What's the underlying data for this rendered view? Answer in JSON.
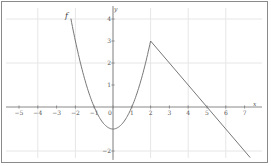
{
  "chart_data": {
    "type": "line",
    "title": "",
    "function_label": "f",
    "xlabel": "x",
    "ylabel": "y",
    "xlim": [
      -5.3,
      7.8
    ],
    "ylim": [
      -2.6,
      4.5
    ],
    "x_ticks": [
      -5,
      -4,
      -3,
      -2,
      -1,
      0,
      1,
      2,
      3,
      4,
      5,
      6,
      7
    ],
    "y_ticks": [
      -2,
      1,
      2,
      3,
      4
    ],
    "grid": true,
    "series": [
      {
        "name": "f",
        "description": "parabola y = x^2 - 1 for x in [-2.24, 2], then line from (2,3) with slope -1 to (7.3,-2.3)",
        "x": [
          -2.24,
          -2,
          -1.5,
          -1,
          -0.5,
          0,
          0.5,
          1,
          1.5,
          2,
          5,
          7.3
        ],
        "y": [
          4.0,
          3.0,
          1.25,
          0,
          -0.75,
          -1,
          -0.75,
          0,
          1.25,
          3.0,
          0,
          -2.3
        ]
      }
    ],
    "colors": {
      "curve": "#777777",
      "axis": "#888888",
      "grid": "#e6e6e6",
      "border": "#8a8a8a"
    }
  }
}
